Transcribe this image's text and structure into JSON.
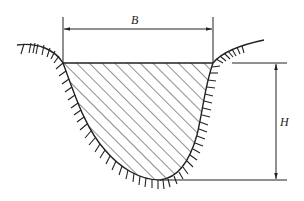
{
  "diagram": {
    "type": "channel-cross-section",
    "labels": {
      "width": "B",
      "depth": "H"
    },
    "colors": {
      "line": "#222222",
      "hatch": "#333333",
      "background": "#ffffff"
    }
  }
}
